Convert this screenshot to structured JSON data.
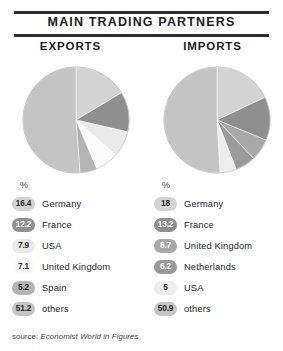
{
  "header": {
    "title": "MAIN TRADING PARTNERS"
  },
  "panels": {
    "exports_caption": "EXPORTS",
    "imports_caption": "IMPORTS"
  },
  "units": {
    "percent_symbol": "%"
  },
  "source": {
    "prefix": "source:",
    "title": "Economist World in Figures"
  },
  "palette": {
    "germany": "#d3d3d3",
    "france": "#8f8f8f",
    "usa": "#eaeaea",
    "united_kingdom": "#fbfbfb",
    "spain": "#b4b4b4",
    "netherlands": "#a3a3a3",
    "others": "#c5c5c5",
    "rule": "#2e2e2e"
  },
  "chart_data": [
    {
      "type": "pie",
      "title": "EXPORTS",
      "unit": "%",
      "start_angle": 0,
      "direction": "clockwise",
      "categories": [
        "Germany",
        "France",
        "USA",
        "United Kingdom",
        "Spain",
        "others"
      ],
      "values": [
        16.4,
        12.2,
        7.9,
        7.1,
        5.2,
        51.2
      ],
      "value_labels": [
        "16.4",
        "12.2",
        "7.9",
        "7.1",
        "5.2",
        "51.2"
      ],
      "colors": [
        "#d3d3d3",
        "#8f8f8f",
        "#eaeaea",
        "#fbfbfb",
        "#b4b4b4",
        "#c5c5c5"
      ]
    },
    {
      "type": "pie",
      "title": "IMPORTS",
      "unit": "%",
      "start_angle": 0,
      "direction": "clockwise",
      "categories": [
        "Germany",
        "France",
        "United Kingdom",
        "Netherlands",
        "USA",
        "others"
      ],
      "values": [
        18,
        13.2,
        6.7,
        6.2,
        5,
        50.9
      ],
      "value_labels": [
        "18",
        "13.2",
        "6.7",
        "6.2",
        "5",
        "50.9"
      ],
      "colors": [
        "#d3d3d3",
        "#8f8f8f",
        "#a8a8a8",
        "#9a9a9a",
        "#ededed",
        "#c5c5c5"
      ]
    }
  ],
  "legends": {
    "exports": [
      {
        "value": "16.4",
        "label": "Germany",
        "color": "#d3d3d3",
        "dark": false
      },
      {
        "value": "12.2",
        "label": "France",
        "color": "#8f8f8f",
        "dark": true
      },
      {
        "value": "7.9",
        "label": "USA",
        "color": "#eaeaea",
        "dark": false
      },
      {
        "value": "7.1",
        "label": "United Kingdom",
        "color": "#fbfbfb",
        "dark": false
      },
      {
        "value": "5.2",
        "label": "Spain",
        "color": "#b4b4b4",
        "dark": false
      },
      {
        "value": "51.2",
        "label": "others",
        "color": "#c5c5c5",
        "dark": false
      }
    ],
    "imports": [
      {
        "value": "18",
        "label": "Germany",
        "color": "#d3d3d3",
        "dark": false
      },
      {
        "value": "13.2",
        "label": "France",
        "color": "#8f8f8f",
        "dark": true
      },
      {
        "value": "6.7",
        "label": "United Kingdom",
        "color": "#a8a8a8",
        "dark": true
      },
      {
        "value": "6.2",
        "label": "Netherlands",
        "color": "#9a9a9a",
        "dark": true
      },
      {
        "value": "5",
        "label": "USA",
        "color": "#ededed",
        "dark": false
      },
      {
        "value": "50.9",
        "label": "others",
        "color": "#c5c5c5",
        "dark": false
      }
    ]
  }
}
